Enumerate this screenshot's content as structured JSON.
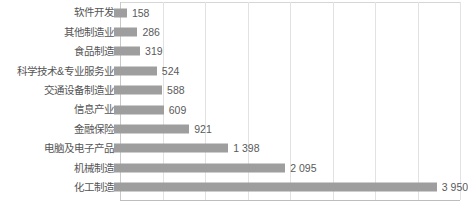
{
  "chart_data": {
    "type": "bar",
    "orientation": "horizontal",
    "title": "",
    "xlabel": "",
    "ylabel": "",
    "grid": true,
    "legend": false,
    "xlim": [
      0,
      4160
    ],
    "gridline_step": 520,
    "thousands_separator": " ",
    "bar_color": "#9e9e9e",
    "label_color": "#555555",
    "value_color": "#5a5a5a",
    "gridline_color": "#e2e2e2",
    "background_color": "#ffffff",
    "categories": [
      "软件开发",
      "其他制造业",
      "食品制造",
      "科学技术&专业服务业",
      "交通设备制造业",
      "信息产业",
      "金融保险",
      "电脑及电子产品",
      "机械制造",
      "化工制造"
    ],
    "values": [
      158,
      286,
      319,
      524,
      588,
      609,
      921,
      1398,
      2095,
      3950
    ],
    "value_labels": [
      "158",
      "286",
      "319",
      "524",
      "588",
      "609",
      "921",
      "1 398",
      "2 095",
      "3 950"
    ],
    "points": [
      {
        "category": "软件开发",
        "value": 158,
        "label": "158"
      },
      {
        "category": "其他制造业",
        "value": 286,
        "label": "286"
      },
      {
        "category": "食品制造",
        "value": 319,
        "label": "319"
      },
      {
        "category": "科学技术&专业服务业",
        "value": 524,
        "label": "524"
      },
      {
        "category": "交通设备制造业",
        "value": 588,
        "label": "588"
      },
      {
        "category": "信息产业",
        "value": 609,
        "label": "609"
      },
      {
        "category": "金融保险",
        "value": 921,
        "label": "921"
      },
      {
        "category": "电脑及电子产品",
        "value": 1398,
        "label": "1 398"
      },
      {
        "category": "机械制造",
        "value": 2095,
        "label": "2 095"
      },
      {
        "category": "化工制造",
        "value": 3950,
        "label": "3 950"
      }
    ]
  }
}
